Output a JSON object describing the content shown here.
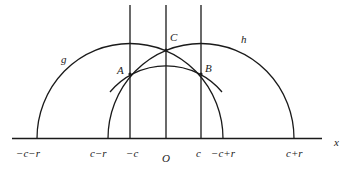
{
  "diagram": {
    "axis_label": "x",
    "origin_label": "O",
    "curves": [
      {
        "name": "g",
        "label": "g"
      },
      {
        "name": "h",
        "label": "h"
      }
    ],
    "points": [
      {
        "name": "A",
        "label": "A"
      },
      {
        "name": "B",
        "label": "B"
      },
      {
        "name": "C",
        "label": "C"
      }
    ],
    "tick_labels": {
      "neg_c_minus_r": "−c−r",
      "c_minus_r": "c−r",
      "neg_c": "−c",
      "origin": "O",
      "c": "c",
      "neg_c_plus_r": "−c+r",
      "c_plus_r": "c+r"
    },
    "colors": {
      "stroke": "#1a1a1a",
      "background": "#ffffff"
    }
  }
}
